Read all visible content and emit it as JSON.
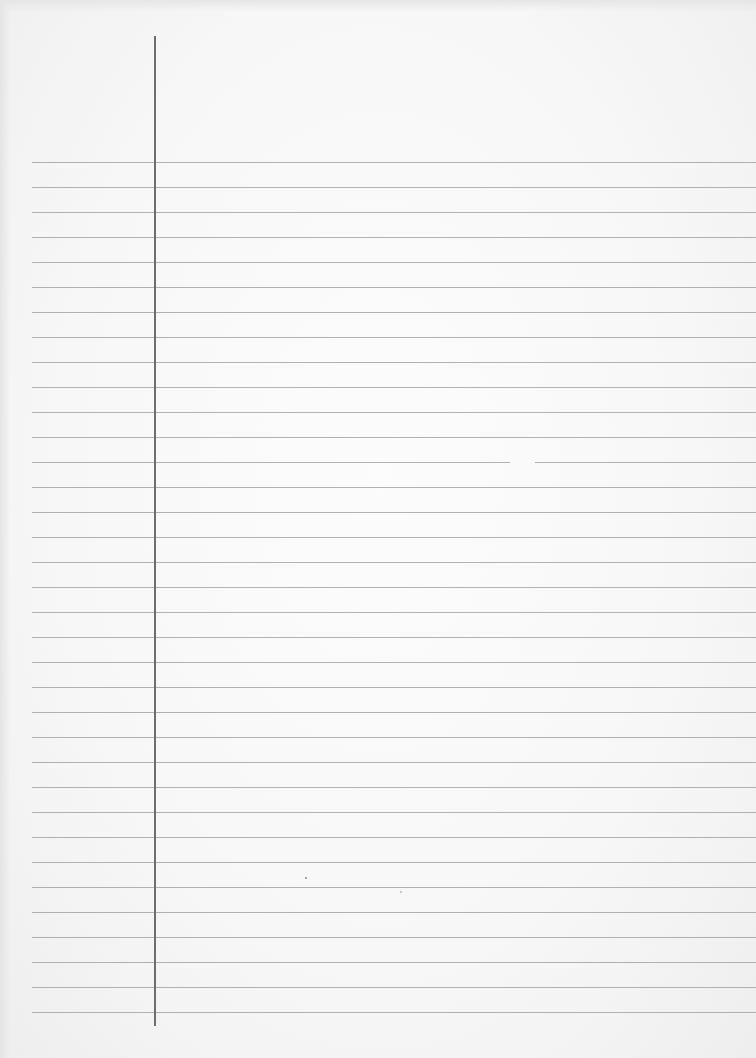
{
  "sheet": {
    "type": "ruled-notebook-paper",
    "background_color": "#f8f8f8",
    "rule_color": "#9a9a9a",
    "margin_line_color": "#6e6e6e",
    "rules": {
      "count": 35,
      "first_y": 162,
      "spacing": 25,
      "left_x": 32
    },
    "margin_line": {
      "x": 154,
      "top_y": 36,
      "bottom_y": 1026
    },
    "text_content": ""
  }
}
